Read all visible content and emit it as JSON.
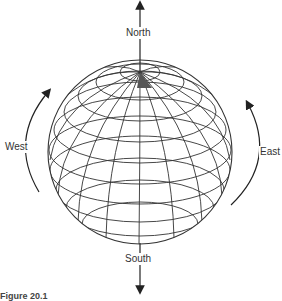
{
  "figure": {
    "type": "globe-rotation-diagram",
    "labels": {
      "north": "North",
      "south": "South",
      "west": "West",
      "east": "East"
    },
    "caption": "Figure 20.1",
    "colors": {
      "line": "#333333",
      "shaded_cell": "#555555",
      "background": "#ffffff"
    }
  }
}
